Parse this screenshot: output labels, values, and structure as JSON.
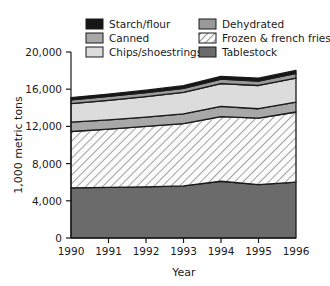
{
  "chart_data": {
    "type": "area",
    "title": "",
    "subtitle": "",
    "xlabel": "Year",
    "ylabel": "1,000 metric tons",
    "categories": [
      "1990",
      "1991",
      "1992",
      "1993",
      "1994",
      "1995",
      "1996"
    ],
    "x": [
      1990,
      1991,
      1992,
      1993,
      1994,
      1995,
      1996
    ],
    "xlim": [
      1990,
      1996
    ],
    "ylim": [
      0,
      20000
    ],
    "ytick_labels": [
      "0",
      "4,000",
      "8,000",
      "12,000",
      "16,000",
      "20,000"
    ],
    "ytick_values": [
      0,
      4000,
      8000,
      12000,
      16000,
      20000
    ],
    "grid": false,
    "stacked": true,
    "legend_position": "top",
    "series": [
      {
        "name": "Tablestock",
        "order": 1,
        "color": "#6b6b6b",
        "pattern": "solid",
        "values": [
          5400,
          5450,
          5500,
          5600,
          6100,
          5750,
          6000
        ]
      },
      {
        "name": "Frozen & french fries",
        "order": 2,
        "color": "#f2f2f2",
        "pattern": "hatch",
        "values": [
          6050,
          6250,
          6500,
          6700,
          6950,
          7150,
          7550
        ]
      },
      {
        "name": "Canned",
        "order": 3,
        "color": "#a8a8a8",
        "pattern": "solid",
        "values": [
          1000,
          1000,
          1000,
          1050,
          1100,
          1000,
          1050
        ]
      },
      {
        "name": "Chips/shoestrings",
        "order": 4,
        "color": "#dcdcdc",
        "pattern": "solid",
        "values": [
          2000,
          2100,
          2200,
          2300,
          2450,
          2500,
          2600
        ]
      },
      {
        "name": "Dehydrated",
        "order": 5,
        "color": "#9a9a9a",
        "pattern": "solid",
        "values": [
          400,
          420,
          430,
          450,
          480,
          480,
          500
        ]
      },
      {
        "name": "Starch/flour",
        "order": 6,
        "color": "#161616",
        "pattern": "solid",
        "values": [
          250,
          260,
          270,
          280,
          300,
          300,
          320
        ]
      }
    ],
    "totals": [
      15100,
      15480,
      15900,
      16380,
      17380,
      17180,
      18020
    ]
  },
  "legend": {
    "items": [
      {
        "label": "Starch/flour",
        "swatch": "#161616",
        "pattern": "solid"
      },
      {
        "label": "Dehydrated",
        "swatch": "#9a9a9a",
        "pattern": "solid"
      },
      {
        "label": "Canned",
        "swatch": "#a8a8a8",
        "pattern": "solid"
      },
      {
        "label": "Frozen & french fries",
        "swatch": "#f2f2f2",
        "pattern": "hatch"
      },
      {
        "label": "Chips/shoestrings",
        "swatch": "#dcdcdc",
        "pattern": "solid"
      },
      {
        "label": "Tablestock",
        "swatch": "#6b6b6b",
        "pattern": "solid"
      }
    ]
  },
  "axes": {
    "y_title": "1,000 metric tons",
    "x_title": "Year",
    "y_labels": [
      "20,000",
      "16,000",
      "12,000",
      "8,000",
      "4,000",
      "0"
    ],
    "x_labels": [
      "1990",
      "1991",
      "1992",
      "1993",
      "1994",
      "1995",
      "1996"
    ]
  },
  "colors": {
    "axis": "#1a1a1a",
    "outline": "#1a1a1a",
    "background": "#ffffff"
  }
}
